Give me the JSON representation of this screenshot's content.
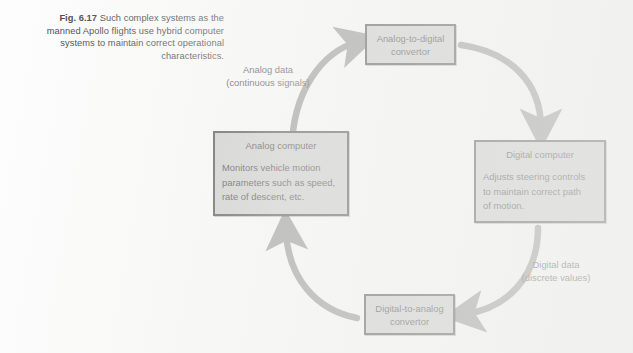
{
  "figure": {
    "caption_label": "Fig. 6.17",
    "caption_text": " Such complex systems as the manned Apollo flights use hybrid computer systems to maintain correct operational characteristics.",
    "diagram_type": "cycle-flow-diagram"
  },
  "nodes": {
    "analog_to_digital": {
      "title": "Analog-to-digital\nconvertor"
    },
    "digital_computer": {
      "title": "Digital computer",
      "body": "Adjusts steering controls\nto maintain correct path\nof motion."
    },
    "digital_to_analog": {
      "title": "Digital-to-analog\nconvertor"
    },
    "analog_computer": {
      "title": "Analog computer",
      "body": "Monitors vehicle motion\nparameters such as speed,\nrate of descent, etc."
    }
  },
  "edges": {
    "analog_data": {
      "label": "Analog data\n(continuous signals)",
      "from": "analog_computer",
      "to": "analog_to_digital"
    },
    "adc_to_digital": {
      "label": "",
      "from": "analog_to_digital",
      "to": "digital_computer"
    },
    "digital_data": {
      "label": "Digital data\n(discrete values)",
      "from": "digital_computer",
      "to": "digital_to_analog"
    },
    "dac_to_analog": {
      "label": "",
      "from": "digital_to_analog",
      "to": "analog_computer"
    }
  },
  "colors": {
    "box_fill": "#c9c9c9",
    "box_border": "#3b3b3b",
    "arrow": "#878787",
    "text": "#2a2a2a",
    "page": "#fdfdfd"
  }
}
